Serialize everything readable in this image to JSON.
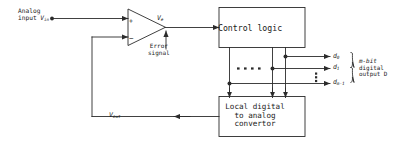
{
  "diagram": {
    "stroke_color": "#2b2b2b",
    "background": "#ffffff",
    "labels": {
      "analog_input_line1": "Analog",
      "analog_input_line2": "input ",
      "analog_input_symbol": "V",
      "analog_input_subscript": "in",
      "error_voltage_symbol": "V",
      "error_voltage_subscript": "e",
      "error_signal_line1": "Error",
      "error_signal_line2": "signal",
      "control_logic": "Control logic",
      "dac_line1": "Local digital",
      "dac_line2": "to analog",
      "dac_line3": "convertor",
      "feedback_symbol": "V",
      "feedback_subscript": "out",
      "bit_0_symbol": "d",
      "bit_0_subscript": "0",
      "bit_1_symbol": "d",
      "bit_1_subscript": "1",
      "bit_m_symbol": "d",
      "bit_m_subscript": "m-1",
      "output_bus_line1": "m-bit",
      "output_bus_line2": "digital",
      "output_bus_line3": "output D",
      "opamp_plus": "+",
      "opamp_minus": "−"
    }
  }
}
